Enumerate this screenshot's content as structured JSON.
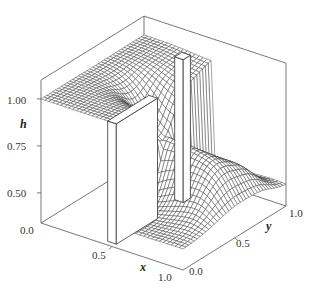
{
  "chart_data": {
    "type": "surface3d",
    "title": "",
    "xlabel": "x",
    "ylabel": "y",
    "zlabel": "h",
    "x_ticks": [
      "0.0",
      "0.5",
      "1.0"
    ],
    "y_ticks": [
      "0.0",
      "0.5",
      "1.0"
    ],
    "z_ticks": [
      "0.50",
      "0.75",
      "1.00"
    ],
    "xlim": [
      0,
      1
    ],
    "ylim": [
      0,
      1
    ],
    "zlim": [
      0.34,
      1.1
    ],
    "grid": false,
    "upstream_level": 1.0,
    "downstream_level": 0.45,
    "dam_x": 0.5,
    "obstacles": [
      {
        "name": "dam-left",
        "x": [
          0.47,
          0.53
        ],
        "y": [
          0.0,
          0.4
        ],
        "top": 1.0
      },
      {
        "name": "dam-right",
        "x": [
          0.47,
          0.53
        ],
        "y": [
          0.65,
          0.72
        ],
        "top": 1.12
      }
    ]
  }
}
